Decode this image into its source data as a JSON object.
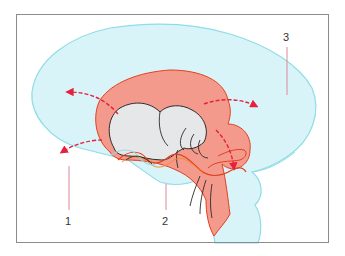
{
  "figure": {
    "type": "anatomical-diagram",
    "labels": [
      {
        "id": "1",
        "text": "1"
      },
      {
        "id": "2",
        "text": "2"
      },
      {
        "id": "3",
        "text": "3"
      }
    ],
    "colors": {
      "outer_fill": "#d9f4f8",
      "outer_stroke": "#8fdde6",
      "inner_fill": "#f49a8c",
      "inner_stroke": "#e2401f",
      "core_fill": "#e6e7e8",
      "core_stroke": "#2b2b2b",
      "arrow": "#e5213c",
      "leader_line": "#d98a9a",
      "frame": "#8c8c8c"
    },
    "arrows": [
      {
        "id": "arrow-upper-left",
        "direction": "outward-up-left"
      },
      {
        "id": "arrow-lower-left",
        "direction": "outward-left"
      },
      {
        "id": "arrow-upper-right",
        "direction": "outward-right"
      },
      {
        "id": "arrow-lower-right",
        "direction": "downward"
      }
    ]
  }
}
